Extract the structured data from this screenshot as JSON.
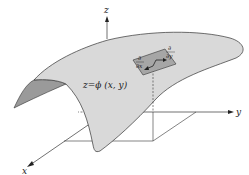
{
  "diagram": {
    "type": "3d-surface-illustration",
    "axes": {
      "z_label": "z",
      "y_label": "y",
      "x_label": "x"
    },
    "surface_label": "z=ϕ (x, y)",
    "tangent_vectors": {
      "dx_numerator": "∂",
      "dx_denominator": "∂x",
      "dy_numerator": "∂",
      "dy_denominator": "∂y"
    },
    "colors": {
      "surface_fill": "#d9d9d9",
      "surface_underside": "#9a9a9a",
      "tangent_patch": "#a6a6a6",
      "line": "#333333",
      "background": "#ffffff"
    }
  }
}
